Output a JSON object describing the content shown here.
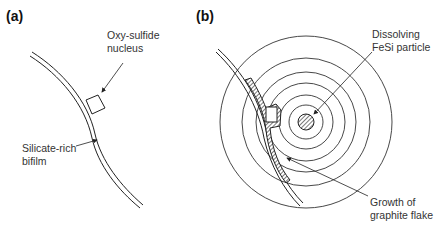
{
  "panels": [
    {
      "id": "a",
      "label": "(a)",
      "annotations": {
        "nucleus_line1": "Oxy-sulfide",
        "nucleus_line2": "nucleus",
        "bifilm_line1": "Silicate-rich",
        "bifilm_line2": "bifilm"
      }
    },
    {
      "id": "b",
      "label": "(b)",
      "annotations": {
        "particle_line1": "Dissolving",
        "particle_line2": "FeSi particle",
        "growth_line1": "Growth of",
        "growth_line2": "graphite flake"
      }
    }
  ]
}
